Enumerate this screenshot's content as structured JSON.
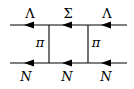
{
  "diagram": {
    "type": "feynman-box-diagram",
    "top_line": {
      "segments": [
        {
          "label": "Λ",
          "x": 30
        },
        {
          "label": "Σ",
          "x": 68
        },
        {
          "label": "Λ",
          "x": 107
        }
      ]
    },
    "bottom_line": {
      "segments": [
        {
          "label": "N",
          "x": 25
        },
        {
          "label": "N",
          "x": 67
        },
        {
          "label": "N",
          "x": 106
        }
      ]
    },
    "exchange_lines": [
      {
        "label": "π",
        "x": 49
      },
      {
        "label": "π",
        "x": 88
      }
    ],
    "colors": {
      "line": "#000000",
      "background": "#ffffff"
    }
  }
}
